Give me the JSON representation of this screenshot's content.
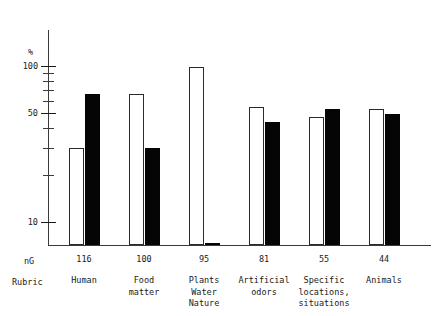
{
  "chart_data": {
    "type": "bar",
    "title": "",
    "subtitle": "",
    "xlabel": "Rubric",
    "ylabel": "%",
    "scale": "log",
    "ylim": [
      6,
      110
    ],
    "grid": false,
    "legend_position": "none",
    "axis_unit_left": "%",
    "axis_unit_bottom": "nG",
    "row_header_label": "Rubric",
    "categories": [
      "Human",
      "Food matter",
      "Plants Water Nature",
      "Artificial odors",
      "Specific locations, situations",
      "Animals"
    ],
    "category_lines": [
      [
        "Human"
      ],
      [
        "Food",
        "matter"
      ],
      [
        "Plants",
        "Water",
        "Nature"
      ],
      [
        "Artificial",
        "odors"
      ],
      [
        "Specific",
        "locations,",
        "situations"
      ],
      [
        "Animals"
      ]
    ],
    "counts": [
      "116",
      "100",
      "95",
      "81",
      "55",
      "44"
    ],
    "tick_values": [
      100,
      90,
      80,
      70,
      60,
      50,
      40,
      30,
      20,
      10
    ],
    "tick_labels": [
      "100",
      "",
      "",
      "",
      "",
      "50",
      "",
      "",
      "",
      "10"
    ],
    "series": [
      {
        "name": "open",
        "style": "white-outlined",
        "color": "#ffffff",
        "values": [
          30,
          66,
          98,
          55,
          47,
          53
        ]
      },
      {
        "name": "filled",
        "style": "black-solid",
        "color": "#050505",
        "values": [
          66,
          30,
          6,
          44,
          53,
          49
        ]
      }
    ]
  },
  "colors": {
    "axis": "#3a3a3a",
    "text": "#1a1a1a",
    "bar_open_fill": "#ffffff",
    "bar_open_stroke": "#2b2b2b",
    "bar_filled": "#050505",
    "background": "#ffffff"
  }
}
